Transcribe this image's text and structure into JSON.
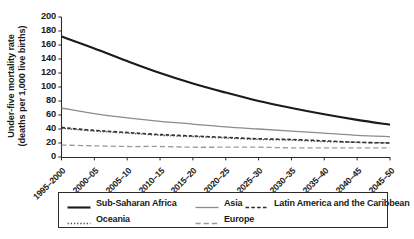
{
  "chart_data": {
    "type": "line",
    "title": "",
    "xlabel": "",
    "ylabel": "Under-five mortality rate (deaths per 1,000 live births)",
    "ylabel_line1": "Under-five mortality rate",
    "ylabel_line2": "(deaths per 1,000 live births)",
    "ylim": [
      0,
      200
    ],
    "yticks": [
      0,
      20,
      40,
      60,
      80,
      100,
      120,
      140,
      160,
      180,
      200
    ],
    "ytick_labels": [
      "0",
      "20",
      "40",
      "60",
      "80",
      "100",
      "120",
      "140",
      "160",
      "180",
      "200"
    ],
    "grid": false,
    "legend_position": "below-plot",
    "categories": [
      "1995–2000",
      "2000–05",
      "2005–10",
      "2010–15",
      "2015–20",
      "2020–25",
      "2025–30",
      "2030–35",
      "2035–40",
      "2040–45",
      "2045–50"
    ],
    "series": [
      {
        "name": "Sub-Saharan Africa",
        "style": "solid",
        "color": "#1a1a1a",
        "width": 2.1,
        "values": [
          172,
          155,
          137,
          120,
          105,
          92,
          80,
          70,
          61,
          53,
          46
        ]
      },
      {
        "name": "Asia",
        "style": "solid",
        "color": "#8c8c8c",
        "width": 1.3,
        "values": [
          70,
          62,
          56,
          51,
          47,
          43,
          40,
          37,
          34,
          31,
          29
        ]
      },
      {
        "name": "Latin America and the Caribbean",
        "style": "dashed",
        "color": "#2b2b2b",
        "width": 1.6,
        "values": [
          42,
          38,
          35,
          32,
          30,
          28,
          26,
          25,
          23,
          21,
          20
        ]
      },
      {
        "name": "Oceania",
        "style": "dotted",
        "color": "#4d4d4d",
        "width": 1.3,
        "values": [
          41,
          37,
          34,
          31,
          29,
          27,
          25,
          24,
          22,
          21,
          20
        ]
      },
      {
        "name": "Europe",
        "style": "longdash",
        "color": "#9a9a9a",
        "width": 1.3,
        "values": [
          17,
          16,
          15,
          15,
          14,
          14,
          14,
          13,
          13,
          13,
          13
        ]
      }
    ]
  },
  "legend": {
    "row1": [
      "Sub-Saharan Africa",
      "Asia",
      "Latin America and the Caribbean"
    ],
    "row2": [
      "Oceania",
      "Europe"
    ]
  }
}
